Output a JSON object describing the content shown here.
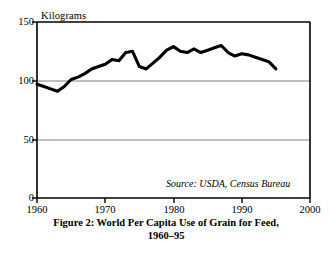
{
  "figure": {
    "caption_line1": "Figure 2: World Per Capita Use of Grain for Feed,",
    "caption_line2": "1960–95",
    "source_note": "Source: USDA, Census Bureau"
  },
  "colors": {
    "line": "#000000",
    "axis": "#000000",
    "grid": "#808080",
    "background": "#ffffff"
  },
  "chart_data": {
    "type": "line",
    "title": "Figure 2: World Per Capita Use of Grain for Feed, 1960–95",
    "xlabel": "",
    "ylabel": "Kilograms",
    "ylabel_position": "above-axis",
    "xlim": [
      1960,
      2000
    ],
    "ylim": [
      0,
      150
    ],
    "yticks": [
      0,
      50,
      100,
      150
    ],
    "ytick_labels": [
      "0",
      "50",
      "100",
      "150"
    ],
    "xticks": [
      1960,
      1970,
      1980,
      1990,
      2000
    ],
    "xtick_labels": [
      "1960",
      "1970",
      "1980",
      "1990",
      "2000"
    ],
    "grid": "horizontal-at-50-and-100",
    "legend": "none",
    "annotations": [
      "Source: USDA, Census Bureau"
    ],
    "series": [
      {
        "name": "World per capita grain use for feed",
        "units": "kilograms",
        "x": [
          1960,
          1961,
          1962,
          1963,
          1964,
          1965,
          1966,
          1967,
          1968,
          1969,
          1970,
          1971,
          1972,
          1973,
          1974,
          1975,
          1976,
          1977,
          1978,
          1979,
          1980,
          1981,
          1982,
          1983,
          1984,
          1985,
          1986,
          1987,
          1988,
          1989,
          1990,
          1991,
          1992,
          1993,
          1994,
          1995
        ],
        "values": [
          97,
          95,
          93,
          91,
          95,
          101,
          103,
          106,
          110,
          112,
          114,
          118,
          117,
          124,
          125,
          112,
          110,
          115,
          120,
          126,
          129,
          125,
          124,
          127,
          124,
          126,
          128,
          130,
          124,
          121,
          123,
          122,
          120,
          118,
          116,
          110
        ]
      }
    ]
  }
}
